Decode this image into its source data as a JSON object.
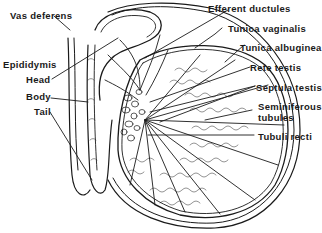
{
  "diagram": {
    "colors": {
      "ink": "#1a1a1a",
      "background": "#ffffff"
    },
    "labels": {
      "vas_deferens": "Vas deferens",
      "epididymis": "Epididymis",
      "head": "Head",
      "body": "Body",
      "tail": "Tail",
      "efferent_ductules": "Efferent ductules",
      "tunica_vaginalis": "Tunica vaginalis",
      "tunica_albuginea": "Tunica albuginea",
      "rete_testis": "Rete testis",
      "septula_testis": "Septula testis",
      "seminiferous_tubules_1": "Seminiferous",
      "seminiferous_tubules_2": "tubules",
      "tubuli_recti": "Tubuli recti"
    }
  }
}
